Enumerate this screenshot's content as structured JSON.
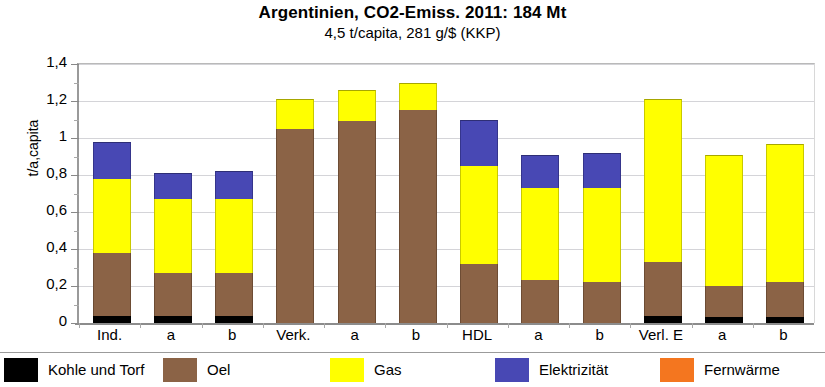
{
  "chart_data": {
    "type": "bar",
    "title": "Argentinien, CO2-Emiss. 2011: 184 Mt",
    "subtitle": "4,5  t/capita,  281 g/$ (KKP)",
    "xlabel": "",
    "ylabel": "t/a,capita",
    "ylim": [
      0,
      1.4
    ],
    "ytick_labels": [
      "0",
      "0,2",
      "0,4",
      "0,6",
      "0,8",
      "1",
      "1,2",
      "1,4"
    ],
    "ytick_values": [
      0,
      0.2,
      0.4,
      0.6,
      0.8,
      1.0,
      1.2,
      1.4
    ],
    "grid": true,
    "stacked": true,
    "legend_position": "bottom",
    "categories": [
      "Ind.",
      "a",
      "b",
      "Verk.",
      "a",
      "b",
      "HDL",
      "a",
      "b",
      "Verl. E",
      "a",
      "b"
    ],
    "series": [
      {
        "name": "Kohle und Torf",
        "color": "#000000",
        "values": [
          0.04,
          0.04,
          0.04,
          0.0,
          0.0,
          0.0,
          0.0,
          0.0,
          0.0,
          0.04,
          0.03,
          0.03
        ]
      },
      {
        "name": "Oel",
        "color": "#8b6346",
        "values": [
          0.34,
          0.23,
          0.23,
          1.05,
          1.09,
          1.15,
          0.32,
          0.23,
          0.22,
          0.29,
          0.17,
          0.19
        ]
      },
      {
        "name": "Gas",
        "color": "#ffff00",
        "values": [
          0.4,
          0.4,
          0.4,
          0.16,
          0.17,
          0.15,
          0.53,
          0.5,
          0.51,
          0.88,
          0.71,
          0.75
        ]
      },
      {
        "name": "Elektrizität",
        "color": "#4848b4",
        "values": [
          0.2,
          0.14,
          0.15,
          0.0,
          0.0,
          0.0,
          0.25,
          0.18,
          0.19,
          0.0,
          0.0,
          0.0
        ]
      },
      {
        "name": "Fernwärme",
        "color": "#f4761f",
        "values": [
          0.0,
          0.0,
          0.0,
          0.0,
          0.0,
          0.0,
          0.0,
          0.0,
          0.0,
          0.0,
          0.0,
          0.0
        ]
      }
    ],
    "totals": [
      0.98,
      0.81,
      0.82,
      1.21,
      1.26,
      1.3,
      1.1,
      0.91,
      0.92,
      1.21,
      0.91,
      0.97
    ]
  },
  "legend": {
    "items": [
      {
        "label": "Kohle und Torf",
        "color": "#000000"
      },
      {
        "label": "Oel",
        "color": "#8b6346"
      },
      {
        "label": "Gas",
        "color": "#ffff00"
      },
      {
        "label": "Elektrizität",
        "color": "#4848b4"
      },
      {
        "label": "Fernwärme",
        "color": "#f4761f"
      }
    ]
  }
}
